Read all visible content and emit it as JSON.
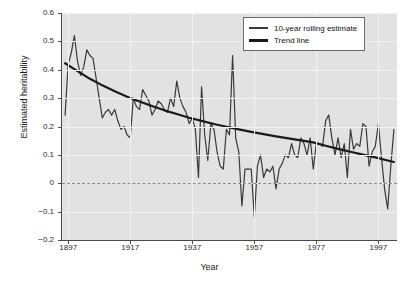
{
  "chart_data": {
    "type": "line",
    "title": "",
    "xlabel": "Year",
    "ylabel": "Estimated heritability",
    "xlim": [
      1895,
      2003
    ],
    "ylim": [
      -0.2,
      0.6
    ],
    "yticks": [
      0.6,
      0.5,
      0.4,
      0.3,
      0.2,
      0.1,
      0,
      -0.1,
      -0.2
    ],
    "ytick_labels": [
      "0.6",
      "0.5",
      "0.4",
      "0.3",
      "0.2",
      "0.1",
      "0",
      "−0.1",
      "−0.2"
    ],
    "xticks": [
      1897,
      1917,
      1937,
      1957,
      1977,
      1997
    ],
    "xtick_labels": [
      "1897",
      "1917",
      "1937",
      "1957",
      "1977",
      "1997"
    ],
    "grid": true,
    "grid_color": "#f2f2f2",
    "plot_background": "#e2e2e2",
    "reference_line": {
      "name": "zero-line",
      "y": 0,
      "style": "dashed",
      "color": "#8a8a8a"
    },
    "legend": {
      "position": "top-right",
      "entries": [
        {
          "label": "10-year rolling estimate",
          "color": "#3a3a3a",
          "width": 1.2
        },
        {
          "label": "Trend line",
          "color": "#1a1a1a",
          "width": 2.2
        }
      ]
    },
    "series": [
      {
        "name": "10-year rolling estimate",
        "color": "#3a3a3a",
        "x": [
          1896,
          1897,
          1898,
          1899,
          1900,
          1901,
          1902,
          1903,
          1904,
          1905,
          1906,
          1907,
          1908,
          1909,
          1910,
          1911,
          1912,
          1913,
          1914,
          1915,
          1916,
          1917,
          1918,
          1919,
          1920,
          1921,
          1922,
          1923,
          1924,
          1925,
          1926,
          1927,
          1928,
          1929,
          1930,
          1931,
          1932,
          1933,
          1934,
          1935,
          1936,
          1937,
          1938,
          1939,
          1940,
          1941,
          1942,
          1943,
          1944,
          1945,
          1946,
          1947,
          1948,
          1949,
          1950,
          1951,
          1952,
          1953,
          1954,
          1955,
          1956,
          1957,
          1958,
          1959,
          1960,
          1961,
          1962,
          1963,
          1964,
          1965,
          1966,
          1967,
          1968,
          1969,
          1970,
          1971,
          1972,
          1973,
          1974,
          1975,
          1976,
          1977,
          1978,
          1979,
          1980,
          1981,
          1982,
          1983,
          1984,
          1985,
          1986,
          1987,
          1988,
          1989,
          1990,
          1991,
          1992,
          1993,
          1994,
          1995,
          1996,
          1997,
          1998,
          1999,
          2000,
          2001,
          2002
        ],
        "y": [
          0.24,
          0.42,
          0.46,
          0.52,
          0.43,
          0.38,
          0.41,
          0.47,
          0.45,
          0.44,
          0.37,
          0.3,
          0.23,
          0.25,
          0.26,
          0.24,
          0.26,
          0.22,
          0.19,
          0.2,
          0.17,
          0.16,
          0.3,
          0.27,
          0.26,
          0.33,
          0.31,
          0.29,
          0.24,
          0.26,
          0.29,
          0.28,
          0.26,
          0.25,
          0.3,
          0.27,
          0.36,
          0.3,
          0.27,
          0.25,
          0.21,
          0.23,
          0.19,
          0.02,
          0.34,
          0.17,
          0.08,
          0.21,
          0.19,
          0.11,
          0.06,
          0.05,
          0.19,
          0.17,
          0.45,
          0.16,
          0.11,
          -0.08,
          0.05,
          0.05,
          0.05,
          -0.12,
          0.06,
          0.1,
          0.02,
          0.05,
          0.04,
          0.06,
          -0.02,
          0.05,
          0.07,
          0.1,
          0.09,
          0.14,
          0.1,
          0.09,
          0.16,
          0.14,
          0.1,
          0.16,
          0.05,
          0.14,
          0.14,
          0.13,
          0.22,
          0.24,
          0.16,
          0.1,
          0.16,
          0.09,
          0.14,
          0.02,
          0.19,
          0.12,
          0.14,
          0.13,
          0.21,
          0.2,
          0.06,
          0.11,
          0.13,
          0.21,
          0.09,
          -0.02,
          -0.09,
          0.06,
          0.19
        ]
      },
      {
        "name": "Trend line",
        "color": "#1a1a1a",
        "x": [
          1896,
          1900,
          1904,
          1908,
          1912,
          1916,
          1920,
          1924,
          1928,
          1932,
          1936,
          1940,
          1944,
          1948,
          1952,
          1956,
          1960,
          1964,
          1968,
          1972,
          1976,
          1980,
          1984,
          1988,
          1992,
          1996,
          2000,
          2002
        ],
        "y": [
          0.423,
          0.395,
          0.368,
          0.345,
          0.324,
          0.305,
          0.288,
          0.272,
          0.257,
          0.244,
          0.231,
          0.22,
          0.209,
          0.199,
          0.19,
          0.181,
          0.173,
          0.165,
          0.158,
          0.151,
          0.144,
          0.132,
          0.121,
          0.111,
          0.101,
          0.091,
          0.08,
          0.075
        ]
      }
    ]
  }
}
